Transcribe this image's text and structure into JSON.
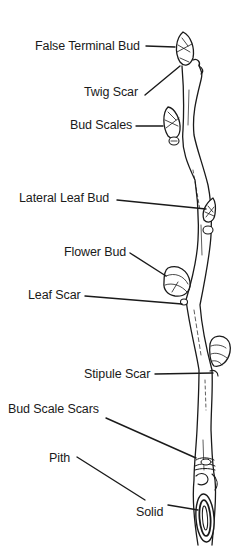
{
  "diagram": {
    "labels": [
      {
        "id": "false-terminal-bud",
        "text": "False Terminal Bud",
        "x": 35,
        "y": 41
      },
      {
        "id": "twig-scar",
        "text": "Twig Scar",
        "x": 84,
        "y": 86
      },
      {
        "id": "bud-scales",
        "text": "Bud Scales",
        "x": 70,
        "y": 120
      },
      {
        "id": "lateral-leaf-bud",
        "text": "Lateral Leaf Bud",
        "x": 19,
        "y": 192
      },
      {
        "id": "flower-bud",
        "text": "Flower Bud",
        "x": 64,
        "y": 246
      },
      {
        "id": "leaf-scar",
        "text": "Leaf Scar",
        "x": 28,
        "y": 289
      },
      {
        "id": "stipule-scar",
        "text": "Stipule Scar",
        "x": 84,
        "y": 369
      },
      {
        "id": "bud-scale-scars",
        "text": "Bud Scale Scars",
        "x": 8,
        "y": 403
      },
      {
        "id": "pith",
        "text": "Pith",
        "x": 49,
        "y": 453
      },
      {
        "id": "solid",
        "text": "Solid",
        "x": 136,
        "y": 506
      }
    ],
    "colors": {
      "ink": "#1a1a1a",
      "background": "#ffffff"
    }
  }
}
